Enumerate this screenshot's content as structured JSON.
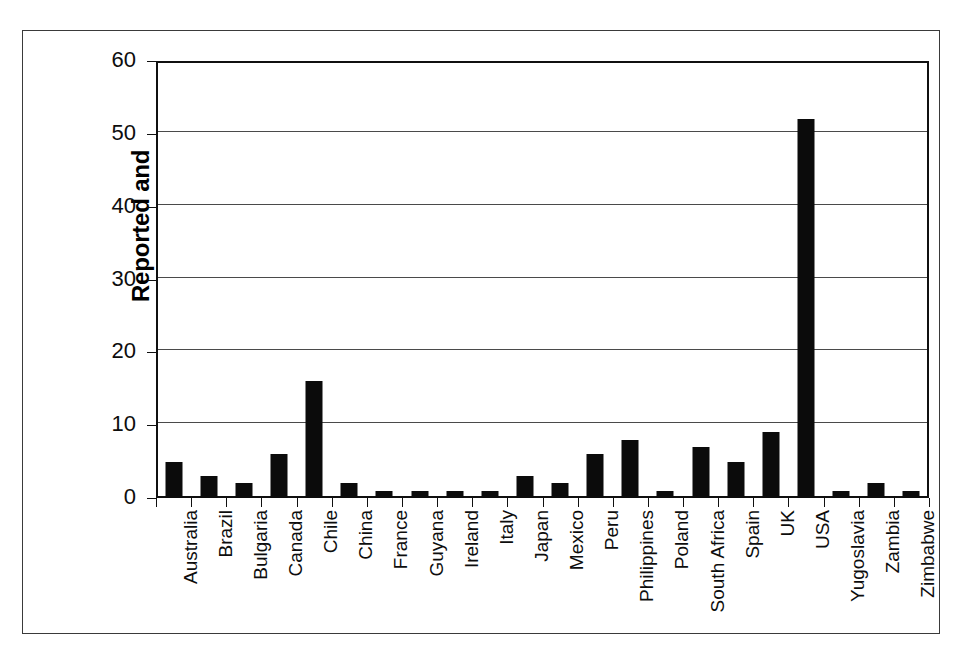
{
  "chart_data": {
    "type": "bar",
    "title": "",
    "xlabel": "",
    "ylabel": "Reported and Documented Failures",
    "ylabel_lines": [
      "Reported and",
      "Documented Failures"
    ],
    "ylim": [
      0,
      60
    ],
    "yticks": [
      0,
      10,
      20,
      30,
      40,
      50,
      60
    ],
    "ytick_labels": [
      "0",
      "10",
      "20",
      "30",
      "40",
      "50",
      "60"
    ],
    "grid": true,
    "grid_axis": "y",
    "legend": false,
    "legend_position": "none",
    "bar_color": "#0b0b0b",
    "categories": [
      "Australia",
      "Brazil",
      "Bulgaria",
      "Canada",
      "Chile",
      "China",
      "France",
      "Guyana",
      "Ireland",
      "Italy",
      "Japan",
      "Mexico",
      "Peru",
      "Philippines",
      "Poland",
      "South Africa",
      "Spain",
      "UK",
      "USA",
      "Yugoslavia",
      "Zambia",
      "Zimbabwe"
    ],
    "values": [
      5,
      3,
      2,
      6,
      16,
      2,
      1,
      1,
      1,
      1,
      3,
      2,
      6,
      8,
      1,
      7,
      5,
      9,
      52,
      1,
      2,
      1
    ]
  },
  "figure": {
    "frame_color": "#3a3a3a",
    "axis_color": "#101010",
    "background": "#ffffff"
  }
}
